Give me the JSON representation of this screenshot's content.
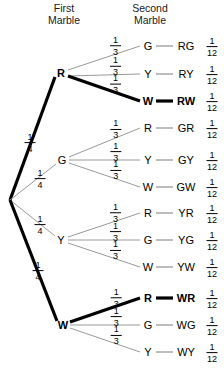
{
  "headers": {
    "first": {
      "line1": "First",
      "line2": "Marble"
    },
    "second": {
      "line1": "Second",
      "line2": "Marble"
    }
  },
  "colors": {
    "thin_branch": "#9a9a9a",
    "thick_branch": "#000000",
    "text": "#000000",
    "background": "#ffffff"
  },
  "root": {
    "x": 10,
    "y": 200
  },
  "level1": [
    {
      "id": "R",
      "label": "R",
      "bold": true,
      "x": 61,
      "y": 73,
      "prob_num": "1",
      "prob_den": "4",
      "prob_x": 30,
      "prob_y": 142,
      "highlighted": true,
      "children": [
        {
          "label": "G",
          "outcome": "RG",
          "prob_num": "1",
          "prob_den": "12",
          "branch_num": "1",
          "branch_den": "3",
          "y": 46,
          "bold": false,
          "highlighted": false
        },
        {
          "label": "Y",
          "outcome": "RY",
          "prob_num": "1",
          "prob_den": "12",
          "branch_num": "1",
          "branch_den": "3",
          "y": 74,
          "bold": false,
          "highlighted": false
        },
        {
          "label": "W",
          "outcome": "RW",
          "prob_num": "1",
          "prob_den": "12",
          "branch_num": "1",
          "branch_den": "3",
          "y": 101,
          "bold": true,
          "highlighted": true
        }
      ]
    },
    {
      "id": "G",
      "label": "G",
      "bold": false,
      "x": 62,
      "y": 160,
      "prob_num": "1",
      "prob_den": "4",
      "prob_x": 40,
      "prob_y": 178,
      "highlighted": false,
      "children": [
        {
          "label": "R",
          "outcome": "GR",
          "prob_num": "1",
          "prob_den": "12",
          "branch_num": "1",
          "branch_den": "3",
          "y": 128,
          "bold": false,
          "highlighted": false
        },
        {
          "label": "Y",
          "outcome": "GY",
          "prob_num": "1",
          "prob_den": "12",
          "branch_num": "1",
          "branch_den": "3",
          "y": 160,
          "bold": false,
          "highlighted": false
        },
        {
          "label": "W",
          "outcome": "GW",
          "prob_num": "1",
          "prob_den": "12",
          "branch_num": "1",
          "branch_den": "3",
          "y": 187,
          "bold": false,
          "highlighted": false
        }
      ]
    },
    {
      "id": "Y",
      "label": "Y",
      "bold": false,
      "x": 61,
      "y": 240,
      "prob_num": "1",
      "prob_den": "4",
      "prob_x": 40,
      "prob_y": 224,
      "highlighted": false,
      "children": [
        {
          "label": "R",
          "outcome": "YR",
          "prob_num": "1",
          "prob_den": "12",
          "branch_num": "1",
          "branch_den": "3",
          "y": 213,
          "bold": false,
          "highlighted": false
        },
        {
          "label": "G",
          "outcome": "YG",
          "prob_num": "1",
          "prob_den": "12",
          "branch_num": "1",
          "branch_den": "3",
          "y": 240,
          "bold": false,
          "highlighted": false
        },
        {
          "label": "W",
          "outcome": "YW",
          "prob_num": "1",
          "prob_den": "12",
          "branch_num": "1",
          "branch_den": "3",
          "y": 267,
          "bold": false,
          "highlighted": false
        }
      ]
    },
    {
      "id": "W",
      "label": "W",
      "bold": true,
      "x": 63,
      "y": 325,
      "prob_num": "1",
      "prob_den": "4",
      "prob_x": 38,
      "prob_y": 270,
      "highlighted": true,
      "children": [
        {
          "label": "R",
          "outcome": "WR",
          "prob_num": "1",
          "prob_den": "12",
          "branch_num": "1",
          "branch_den": "3",
          "y": 298,
          "bold": true,
          "highlighted": true
        },
        {
          "label": "G",
          "outcome": "WG",
          "prob_num": "1",
          "prob_den": "12",
          "branch_num": "1",
          "branch_den": "3",
          "y": 325,
          "bold": false,
          "highlighted": false
        },
        {
          "label": "Y",
          "outcome": "WY",
          "prob_num": "1",
          "prob_den": "12",
          "branch_num": "1",
          "branch_den": "3",
          "y": 352,
          "bold": false,
          "highlighted": false
        }
      ]
    }
  ],
  "layout": {
    "node2_x": 148,
    "outcome_x": 186,
    "frac_x": 212,
    "header_first_x": 64,
    "header_second_x": 150,
    "header_y1": 12,
    "header_y2": 24
  }
}
